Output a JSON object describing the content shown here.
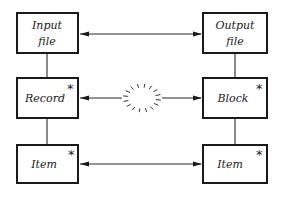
{
  "diagram": {
    "left_column": [
      {
        "id": "input-file",
        "lines": [
          "Input",
          "file"
        ],
        "starred": false
      },
      {
        "id": "record",
        "lines": [
          "Record"
        ],
        "starred": true
      },
      {
        "id": "item-left",
        "lines": [
          "Item"
        ],
        "starred": true
      }
    ],
    "right_column": [
      {
        "id": "output-file",
        "lines": [
          "Output",
          "file"
        ],
        "starred": false
      },
      {
        "id": "block",
        "lines": [
          "Block"
        ],
        "starred": true
      },
      {
        "id": "item-right",
        "lines": [
          "Item"
        ],
        "starred": true
      }
    ],
    "star_symbol": "*",
    "connections": [
      {
        "from": "input-file",
        "to": "output-file",
        "type": "bidirectional-arrow"
      },
      {
        "from": "record",
        "to": "block",
        "type": "bidirectional-arrow-broken",
        "middle": "dashed-circle"
      },
      {
        "from": "item-left",
        "to": "item-right",
        "type": "bidirectional-arrow"
      },
      {
        "from": "input-file",
        "to": "record",
        "type": "line"
      },
      {
        "from": "record",
        "to": "item-left",
        "type": "line"
      },
      {
        "from": "output-file",
        "to": "block",
        "type": "line"
      },
      {
        "from": "block",
        "to": "item-right",
        "type": "line"
      }
    ]
  }
}
